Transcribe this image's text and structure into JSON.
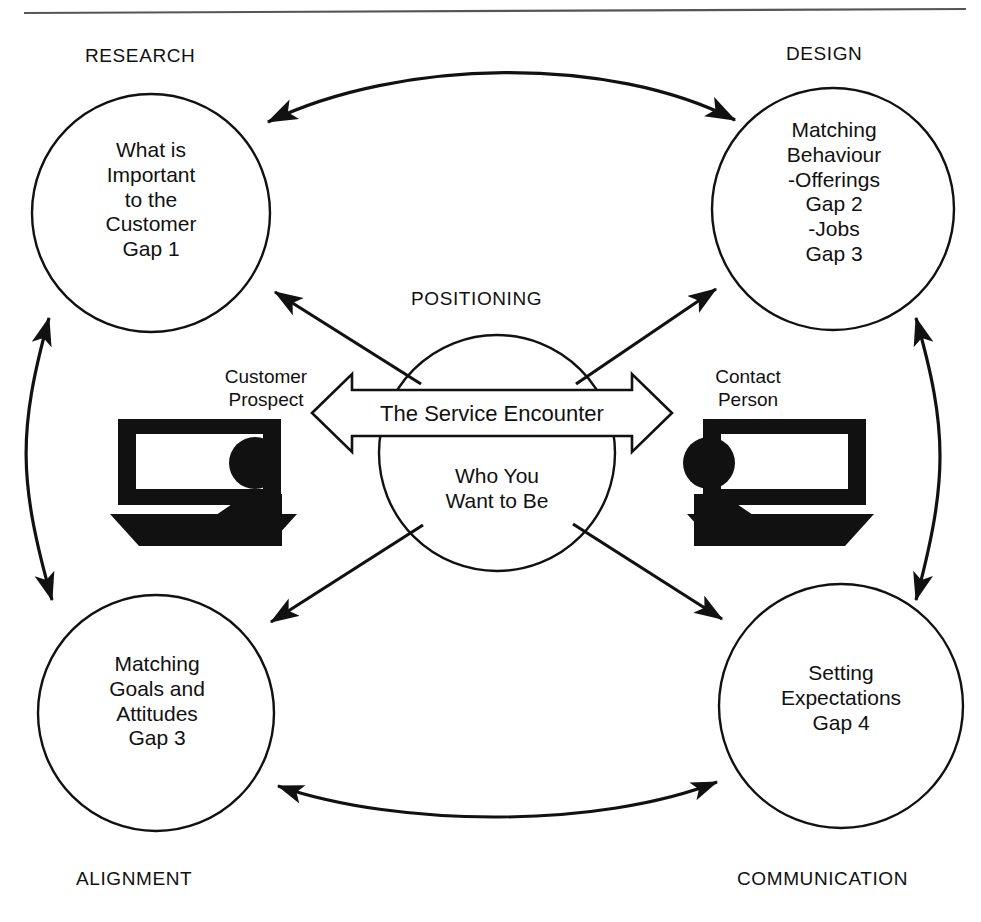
{
  "diagram": {
    "title_rule": "top-divider",
    "stroke_color": "#111111",
    "background": "#ffffff",
    "quadrant_labels": [
      {
        "key": "research",
        "text": "RESEARCH"
      },
      {
        "key": "design",
        "text": "DESIGN"
      },
      {
        "key": "alignment",
        "text": "ALIGNMENT"
      },
      {
        "key": "communication",
        "text": "COMMUNICATION"
      }
    ],
    "center_label": "POSITIONING",
    "circles": [
      {
        "key": "research-circle",
        "lines": [
          "What is",
          "Important",
          "to the",
          "Customer",
          "Gap 1"
        ]
      },
      {
        "key": "design-circle",
        "lines": [
          "Matching",
          "Behaviour",
          "-Offerings",
          "Gap 2",
          "-Jobs",
          "Gap 3"
        ]
      },
      {
        "key": "alignment-circle",
        "lines": [
          "Matching",
          "Goals and",
          "Attitudes",
          "Gap 3"
        ]
      },
      {
        "key": "communication-circle",
        "lines": [
          "Setting",
          "Expectations",
          "Gap 4"
        ]
      }
    ],
    "center": {
      "key": "positioning-circle",
      "lines": [
        "Who You",
        "Want to Be"
      ],
      "band_label": "The Service Encounter"
    },
    "actors": [
      {
        "key": "customer-prospect",
        "lines": [
          "Customer",
          "Prospect"
        ]
      },
      {
        "key": "contact-person",
        "lines": [
          "Contact",
          "Person"
        ]
      }
    ]
  }
}
